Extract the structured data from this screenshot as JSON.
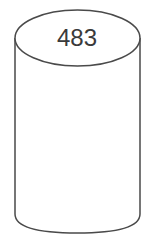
{
  "diagram": {
    "shape": "cylinder",
    "label": "483",
    "stroke_color": "#4a4a4a",
    "fill_color": "#ffffff"
  }
}
